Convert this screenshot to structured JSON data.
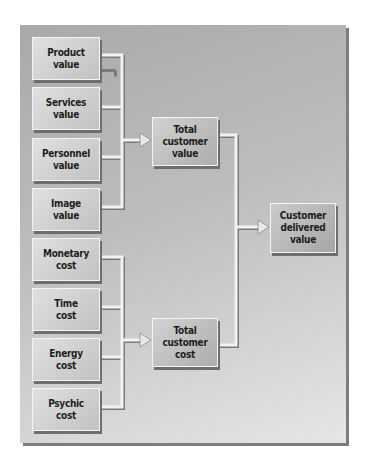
{
  "diagram": {
    "value_inputs": [
      "Product\nvalue",
      "Services\nvalue",
      "Personnel\nvalue",
      "Image\nvalue"
    ],
    "cost_inputs": [
      "Monetary\ncost",
      "Time\ncost",
      "Energy\ncost",
      "Psychic\ncost"
    ],
    "total_value": "Total\ncustomer\nvalue",
    "total_cost": "Total\ncustomer\ncost",
    "delivered": "Customer\ndelivered\nvalue"
  },
  "colors": {
    "panel": "#b5b5b5",
    "box": "#cfcfcf",
    "connector": "#f2f2f2",
    "connector_shadow": "#7a7a7a"
  }
}
